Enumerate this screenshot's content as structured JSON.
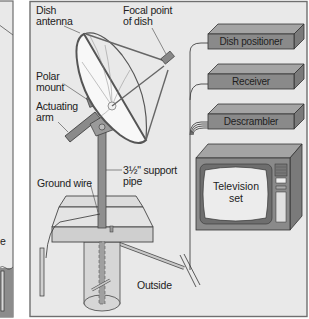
{
  "diagram": {
    "colors": {
      "panel_bg": "#e9e9e9",
      "panel_border": "#6f6f6f",
      "device_fill": "#8a8a8a",
      "device_top": "#a4a4a4",
      "dish_fill": "#f7f7f7",
      "slab_fill": "#d6d6d6",
      "ground_fill": "#8c8c8c"
    },
    "labels": {
      "dish_antenna": [
        "Dish",
        "antenna"
      ],
      "focal_point": [
        "Focal point",
        "of dish"
      ],
      "polar_mount": [
        "Polar",
        "mount"
      ],
      "actuating_arm": [
        "Actuating",
        "arm"
      ],
      "support_pipe": [
        "3½\" support",
        "pipe"
      ],
      "ground_wire": "Ground wire",
      "outside": "Outside"
    },
    "devices": [
      {
        "name": "Dish positioner"
      },
      {
        "name": "Receiver"
      },
      {
        "name": "Descrambler"
      }
    ],
    "television": [
      "Television",
      "set"
    ],
    "left_panel_partial": {
      "visible_text": "e"
    }
  }
}
